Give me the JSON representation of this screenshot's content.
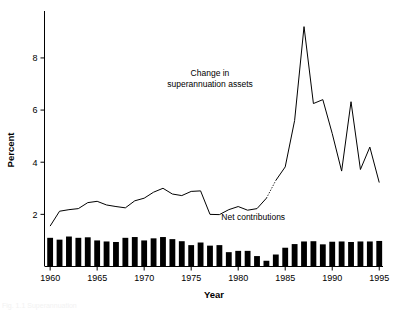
{
  "figure": {
    "background_color": "#ffffff",
    "ink_color": "#000000",
    "clipped_caption": "Fig. 1.1  Superannuation"
  },
  "chart_data": {
    "type": "line",
    "title": "",
    "subtitle": "",
    "xlabel": "Year",
    "ylabel": "Percent",
    "grid": false,
    "legend_position": "inline-annotation",
    "xlim": [
      1959.4,
      1995.4
    ],
    "ylim": [
      0,
      9.8
    ],
    "x_ticks": [
      1960,
      1965,
      1970,
      1975,
      1980,
      1985,
      1990,
      1995
    ],
    "x_tick_labels": [
      "1960",
      "1965",
      "1970",
      "1975",
      "1980",
      "1985",
      "1990",
      "1995"
    ],
    "y_ticks": [
      2,
      4,
      6,
      8
    ],
    "y_tick_labels": [
      "2",
      "4",
      "6",
      "8"
    ],
    "annotations": [
      {
        "id": "line-series-label",
        "lines": [
          "Change in",
          "superannuation assets"
        ],
        "x": 1977.0,
        "y": 7.3
      },
      {
        "id": "bar-series-label",
        "lines": [
          "Net contributions"
        ],
        "x": 1981.6,
        "y": 1.78
      }
    ],
    "series": [
      {
        "name": "Change in superannuation assets",
        "type": "line",
        "style": "solid",
        "color": "#000000",
        "x": [
          1960,
          1961,
          1962,
          1963,
          1964,
          1965,
          1966,
          1967,
          1968,
          1969,
          1970,
          1971,
          1972,
          1973,
          1974,
          1975,
          1976,
          1977,
          1978,
          1979,
          1980,
          1981,
          1982,
          1983
        ],
        "values": [
          1.55,
          2.12,
          2.18,
          2.22,
          2.45,
          2.5,
          2.36,
          2.3,
          2.25,
          2.52,
          2.62,
          2.85,
          3.0,
          2.78,
          2.72,
          2.88,
          2.9,
          2.0,
          1.99,
          2.18,
          2.3,
          2.16,
          2.22,
          2.62
        ]
      },
      {
        "name": "Change in superannuation assets (estimated)",
        "type": "line",
        "style": "dotted",
        "color": "#000000",
        "x": [
          1983,
          1984
        ],
        "values": [
          2.62,
          3.3
        ]
      },
      {
        "name": "Change in superannuation assets (continued)",
        "type": "line",
        "style": "solid",
        "color": "#000000",
        "x": [
          1984,
          1985,
          1986,
          1987,
          1988,
          1989,
          1990,
          1991,
          1992,
          1993,
          1994,
          1995
        ],
        "values": [
          3.3,
          3.82,
          5.6,
          9.2,
          6.25,
          6.4,
          5.1,
          3.66,
          6.32,
          3.72,
          4.58,
          3.22
        ]
      },
      {
        "name": "Net contributions",
        "type": "bar",
        "color": "#000000",
        "x": [
          1960,
          1961,
          1962,
          1963,
          1964,
          1965,
          1966,
          1967,
          1968,
          1969,
          1970,
          1971,
          1972,
          1973,
          1974,
          1975,
          1976,
          1977,
          1978,
          1979,
          1980,
          1981,
          1982,
          1983,
          1984,
          1985,
          1986,
          1987,
          1988,
          1989,
          1990,
          1991,
          1992,
          1993,
          1994,
          1995
        ],
        "values": [
          1.1,
          1.03,
          1.15,
          1.1,
          1.12,
          1.0,
          0.96,
          0.94,
          1.1,
          1.13,
          1.0,
          1.08,
          1.13,
          1.05,
          0.97,
          0.82,
          0.92,
          0.8,
          0.82,
          0.55,
          0.6,
          0.6,
          0.4,
          0.22,
          0.46,
          0.72,
          0.86,
          0.96,
          0.97,
          0.85,
          0.95,
          0.96,
          0.94,
          0.96,
          0.96,
          0.98
        ]
      }
    ]
  }
}
